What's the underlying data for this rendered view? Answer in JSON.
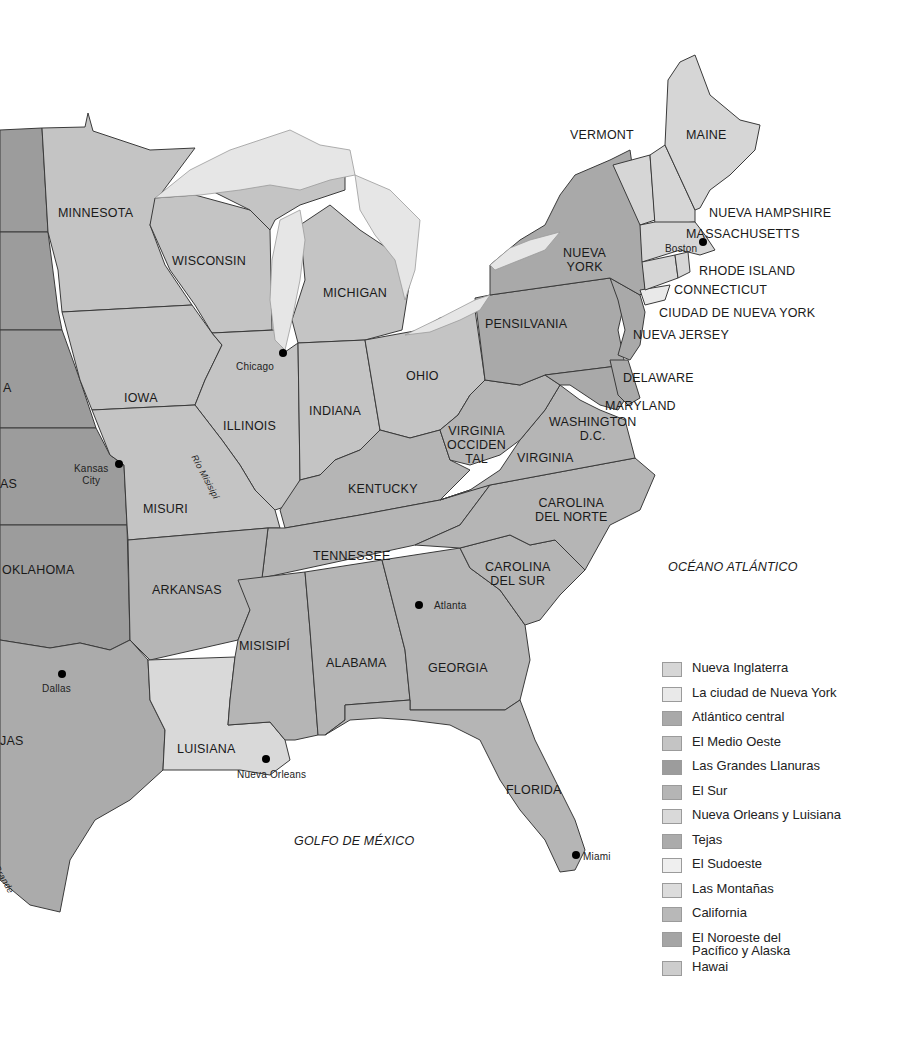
{
  "map": {
    "colors": {
      "nueva_inglaterra": "#d6d6d6",
      "ciudad_nueva_york": "#e9e9e9",
      "atlantico_central": "#a9a9a9",
      "medio_oeste": "#c4c4c4",
      "grandes_llanuras": "#9c9c9c",
      "el_sur": "#b5b5b5",
      "nueva_orleans_luisiana": "#d9d9d9",
      "tejas": "#ababab",
      "sudoeste": "#efefef",
      "montanas": "#dcdcdc",
      "california": "#b8b8b8",
      "noroeste_alaska": "#a5a5a5",
      "hawai": "#cdcdcd",
      "lake": "#e6e6e6",
      "water": "#ffffff"
    },
    "states": {
      "vermont": "VERMONT",
      "maine": "MAINE",
      "nueva_hampshire": "NUEVA HAMPSHIRE",
      "massachusetts": "MASSACHUSETTS",
      "rhode_island": "RHODE ISLAND",
      "connecticut": "CONNECTICUT",
      "ciudad_nueva_york": "CIUDAD DE NUEVA YORK",
      "nueva_york_1": "NUEVA",
      "nueva_york_2": "YORK",
      "nueva_jersey": "NUEVA JERSEY",
      "pensilvania": "PENSILVANIA",
      "delaware": "DELAWARE",
      "maryland": "MARYLAND",
      "washington_1": "WASHINGTON",
      "washington_2": "D.C.",
      "virginia": "VIRGINIA",
      "virginia_occ_1": "VIRGINIA",
      "virginia_occ_2": "OCCIDEN",
      "virginia_occ_3": "TAL",
      "carolina_norte_1": "CAROLINA",
      "carolina_norte_2": "DEL NORTE",
      "carolina_sur_1": "CAROLINA",
      "carolina_sur_2": "DEL SUR",
      "georgia": "GEORGIA",
      "florida": "FLORIDA",
      "alabama": "ALABAMA",
      "misisipi": "MISISIPÍ",
      "tennessee": "TENNESSEE",
      "kentucky": "KENTUCKY",
      "ohio": "OHIO",
      "indiana": "INDIANA",
      "illinois": "ILLINOIS",
      "michigan": "MICHIGAN",
      "wisconsin": "WISCONSIN",
      "minnesota": "MINNESOTA",
      "iowa": "IOWA",
      "misuri": "MISURI",
      "arkansas": "ARKANSAS",
      "luisiana": "LUISIANA",
      "oklahoma": "OKLAHOMA",
      "kansas_partial": "AS",
      "nebraska_partial": "A",
      "texas_partial": "JAS"
    },
    "cities": {
      "boston": "Boston",
      "chicago": "Chicago",
      "kansas_city_1": "Kansas",
      "kansas_city_2": "City",
      "atlanta": "Atlanta",
      "dallas": "Dallas",
      "nueva_orleans": "Nueva Orleans",
      "miami": "Miami"
    },
    "water": {
      "atlantico": "OCÉANO ATLÁNTICO",
      "golfo": "GOLFO DE MÉXICO"
    },
    "rivers": {
      "misisipi": "Río Misisipí",
      "grande": "Grande"
    }
  },
  "legend": {
    "items": [
      {
        "label": "Nueva Inglaterra",
        "color": "#d6d6d6"
      },
      {
        "label": "La ciudad de Nueva York",
        "color": "#e9e9e9"
      },
      {
        "label": "Atlántico central",
        "color": "#a9a9a9"
      },
      {
        "label": "El Medio Oeste",
        "color": "#c4c4c4"
      },
      {
        "label": "Las Grandes Llanuras",
        "color": "#9c9c9c"
      },
      {
        "label": "El Sur",
        "color": "#b5b5b5"
      },
      {
        "label": "Nueva Orleans y Luisiana",
        "color": "#d9d9d9"
      },
      {
        "label": "Tejas",
        "color": "#ababab"
      },
      {
        "label": "El Sudoeste",
        "color": "#efefef"
      },
      {
        "label": "Las Montañas",
        "color": "#dcdcdc"
      },
      {
        "label": "California",
        "color": "#b8b8b8"
      },
      {
        "label": "El Noroeste del\nPacífico y Alaska",
        "color": "#a5a5a5"
      },
      {
        "label": "Hawai",
        "color": "#cdcdcd"
      }
    ]
  }
}
